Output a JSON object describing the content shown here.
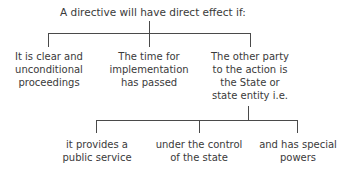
{
  "diagram": {
    "root": {
      "label": "A directive will have direct effect if:"
    },
    "conditions": [
      {
        "lines": [
          "It is clear and",
          "unconditional",
          "proceedings"
        ]
      },
      {
        "lines": [
          "The time for",
          "implementation",
          "has passed"
        ]
      },
      {
        "lines": [
          "The other party",
          "to the action is",
          "the State or",
          "state entity i.e."
        ]
      }
    ],
    "state_entity_criteria": [
      {
        "lines": [
          "it provides a",
          "public service"
        ]
      },
      {
        "lines": [
          "under the control",
          "of the state"
        ]
      },
      {
        "lines": [
          "and has special",
          "powers"
        ]
      }
    ]
  }
}
